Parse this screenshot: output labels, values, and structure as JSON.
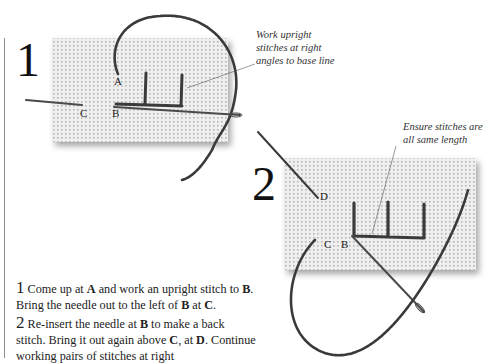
{
  "step1": {
    "number": "1",
    "caption": [
      "Work upright",
      "stitches at right",
      "angles to base line"
    ],
    "labels": {
      "A": "A",
      "B": "B",
      "C": "C"
    }
  },
  "step2": {
    "number": "2",
    "caption": [
      "Ensure stitches are",
      "all same length"
    ],
    "labels": {
      "B": "B",
      "C": "C",
      "D": "D"
    }
  },
  "instructions": [
    {
      "num": "1",
      "segments": [
        {
          "t": " Come up at ",
          "b": false
        },
        {
          "t": "A",
          "b": true
        },
        {
          "t": " and work an upright stitch to ",
          "b": false
        },
        {
          "t": "B",
          "b": true
        },
        {
          "t": ". Bring the needle out to the left of ",
          "b": false
        },
        {
          "t": "B",
          "b": true
        },
        {
          "t": " at ",
          "b": false
        },
        {
          "t": "C",
          "b": true
        },
        {
          "t": ".",
          "b": false
        }
      ]
    },
    {
      "num": "2",
      "segments": [
        {
          "t": " Re-insert the needle at ",
          "b": false
        },
        {
          "t": "B",
          "b": true
        },
        {
          "t": " to make a back stitch. Bring it out again above ",
          "b": false
        },
        {
          "t": "C",
          "b": true
        },
        {
          "t": ", at ",
          "b": false
        },
        {
          "t": "D",
          "b": true
        },
        {
          "t": ". Continue working pairs of stitches at right",
          "b": false
        }
      ]
    }
  ],
  "colors": {
    "fabric": "#ebebeb",
    "fabric_dot": "#b9b9b9",
    "thread": "#3a3a3a",
    "needle": "#4a4a4a",
    "rule": "#8a8a8a"
  }
}
